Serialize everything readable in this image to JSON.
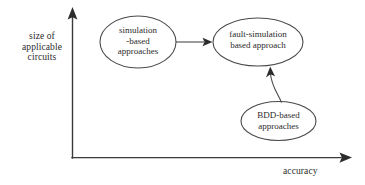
{
  "figure": {
    "background_color": "#ffffff",
    "line_color": "#4a4a4a",
    "text_color": "#2b2b2b"
  },
  "axes": {
    "y": {
      "label_lines": [
        "size of",
        "applicable",
        "circuits"
      ],
      "label": "size of applicable circuits",
      "arrow": "up"
    },
    "x": {
      "label": "accuracy",
      "arrow": "right"
    }
  },
  "nodes": [
    {
      "id": "simulation-based",
      "lines": [
        "simulation",
        "-based",
        "approaches"
      ],
      "label": "simulation -based approaches",
      "shape": "ellipse"
    },
    {
      "id": "fault-simulation-based",
      "lines": [
        "fault-simulation",
        "based approach"
      ],
      "label": "fault-simulation based approach",
      "shape": "ellipse"
    },
    {
      "id": "bdd-based",
      "lines": [
        "BDD-based",
        "approaches"
      ],
      "label": "BDD-based approaches",
      "shape": "ellipse"
    }
  ],
  "edges": [
    {
      "id": "sim-to-fault",
      "from": "simulation-based",
      "to": "fault-simulation-based",
      "style": "straight-arrow"
    },
    {
      "id": "bdd-to-fault",
      "from": "bdd-based",
      "to": "fault-simulation-based",
      "style": "curved-arrow"
    }
  ]
}
